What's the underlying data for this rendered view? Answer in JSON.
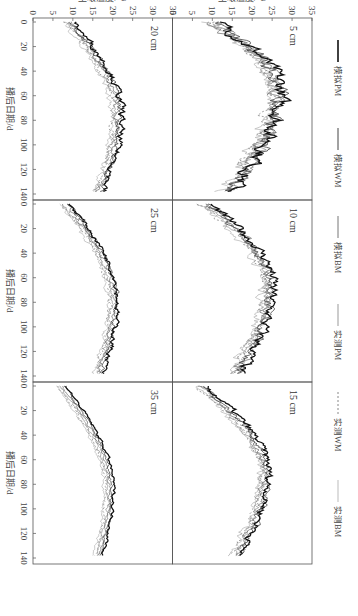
{
  "chart_data": {
    "type": "line",
    "layout": {
      "rows": 2,
      "cols": 3,
      "orientation": "rotated 90° clockwise on page"
    },
    "xlabel": "播后日期/d",
    "ylabel": "土壤温度/℃",
    "xlim": [
      0,
      140
    ],
    "ylim": [
      0,
      35
    ],
    "xticks": [
      0,
      20,
      40,
      60,
      80,
      100,
      120,
      140
    ],
    "yticks": [
      0,
      5,
      10,
      15,
      20,
      25,
      30,
      35
    ],
    "grid": false,
    "legend": {
      "position": "top",
      "entries": [
        {
          "name": "模拟PM",
          "style": "solid-black-thick"
        },
        {
          "name": "模拟WM",
          "style": "solid-dark-gray"
        },
        {
          "name": "模拟BM",
          "style": "solid-gray"
        },
        {
          "name": "实测PM",
          "style": "solid-light-gray"
        },
        {
          "name": "实测WM",
          "style": "dotted-gray"
        },
        {
          "name": "实测BM",
          "style": "solid-pale-gray"
        }
      ]
    },
    "panels": [
      {
        "label": "5 cm",
        "series_shape": {
          "start": 10,
          "peak_day": 58,
          "peak": 26,
          "end": 13,
          "noise": 3.0
        }
      },
      {
        "label": "10 cm",
        "series_shape": {
          "start": 8,
          "peak_day": 65,
          "peak": 24,
          "end": 15,
          "noise": 2.0
        }
      },
      {
        "label": "15 cm",
        "series_shape": {
          "start": 7,
          "peak_day": 72,
          "peak": 23,
          "end": 15,
          "noise": 1.5
        }
      },
      {
        "label": "20 cm",
        "series_shape": {
          "start": 9,
          "peak_day": 75,
          "peak": 21,
          "end": 16,
          "noise": 1.3
        }
      },
      {
        "label": "25 cm",
        "series_shape": {
          "start": 8,
          "peak_day": 78,
          "peak": 20,
          "end": 16,
          "noise": 1.0
        }
      },
      {
        "label": "35 cm",
        "series_shape": {
          "start": 7,
          "peak_day": 85,
          "peak": 19,
          "end": 16,
          "noise": 0.6
        }
      }
    ]
  },
  "labels": {
    "xlabel": "播后日期/d",
    "ylabel": "土壤温度/℃",
    "legend": [
      "模拟PM",
      "模拟WM",
      "模拟BM",
      "实测PM",
      "实测WM",
      "实测BM"
    ],
    "panels": [
      "5 cm",
      "10 cm",
      "15 cm",
      "20 cm",
      "25 cm",
      "35 cm"
    ]
  },
  "colors": {
    "axis": "#555555",
    "series": [
      "#111111",
      "#444444",
      "#777777",
      "#999999",
      "#888888",
      "#bbbbbb"
    ]
  }
}
